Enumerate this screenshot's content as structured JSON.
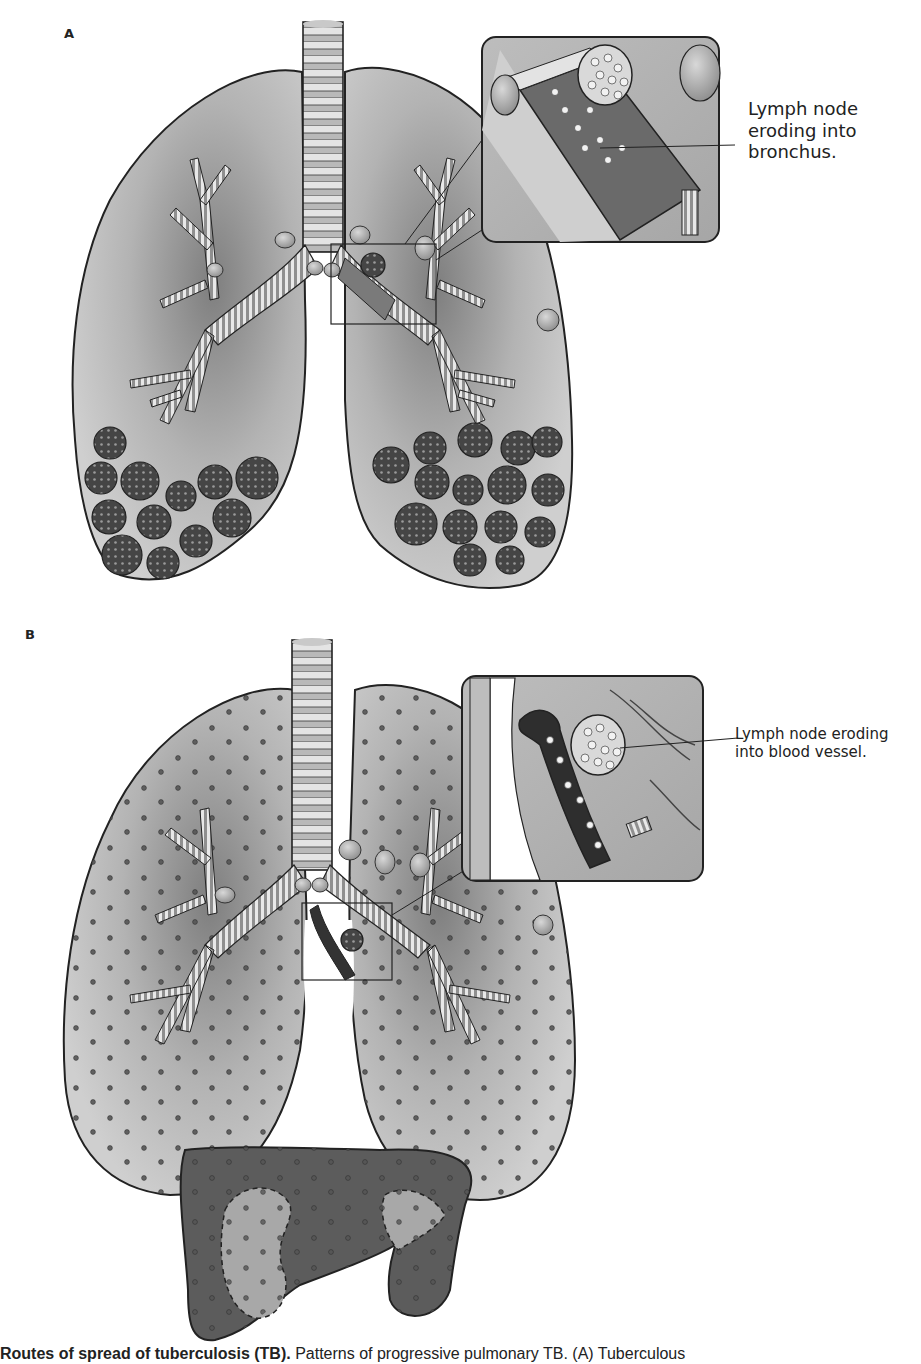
{
  "figure": {
    "panels": [
      {
        "id": "A",
        "label": "A",
        "callout": "Lymph node eroding into bronchus.",
        "callout_lines": [
          "Lymph node",
          "eroding into",
          "bronchus."
        ],
        "description": "Lungs with bronchial tree; caseous lymph node eroding into bronchus; tuberculous bronchopneumonia nodules in lower lobes"
      },
      {
        "id": "B",
        "label": "B",
        "callout": "Lymph node eroding into blood vessel.",
        "callout_lines": [
          "Lymph node eroding",
          "into blood vessel."
        ],
        "description": "Lungs with miliary dissemination (scattered dots); caseous lymph node eroding into blood vessel; miliary spread to liver"
      }
    ],
    "caption": {
      "bold": "Routes of spread of tuberculosis (TB).",
      "text": " Patterns of progressive pulmonary TB. (A) Tuberculous"
    }
  },
  "colors": {
    "lung_fill": "#c4c4c4",
    "lung_shade": "#8a8a8a",
    "outline": "#222222",
    "nodule": "#4a4a4a",
    "liver": "#5e5e5e",
    "liver_light": "#a9a9a9",
    "airway": "#e6e6e6"
  }
}
